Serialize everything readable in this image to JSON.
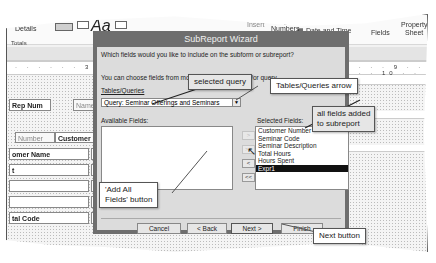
{
  "background": {
    "ribbon": {
      "details_label": "Details",
      "aa_label": "Aa",
      "insert_image_label": "Insert",
      "page_numbers_label": "Page",
      "page_numbers_sub": "Numbers",
      "date_time_label": "Date and Time",
      "add_fields_label": "Fields",
      "property_sheet_label": "Property",
      "property_sheet_sub": "Sheet"
    },
    "totals_label": "Totals",
    "ruler_left": "· · · · · · 3 · · · · · 4 · · · ·",
    "ruler_right": "· · · · 9 · · · · · 10 · ·",
    "report_fields": [
      {
        "label": "Rep Num"
      },
      {
        "label": "Name"
      },
      {
        "label": "Number"
      },
      {
        "label": "Customer Num"
      },
      {
        "label": "omer Name"
      },
      {
        "label": "t"
      },
      {
        "label": ""
      },
      {
        "label": ""
      },
      {
        "label": "tal Code"
      }
    ]
  },
  "dialog": {
    "title": "SubReport Wizard",
    "question": "Which fields would you like to include on the subform or subreport?",
    "instructions": "You can choose fields from more than one table and/or query.",
    "tables_queries_label": "Tables/Queries",
    "tables_queries_value": "Query: Seminar Offerings and Seminars",
    "available_fields_label": "Available Fields:",
    "available_fields": [],
    "selected_fields_label": "Selected Fields:",
    "selected_fields": [
      "Customer Number",
      "Seminar Code",
      "Seminar Description",
      "Total Hours",
      "Hours Spent",
      "Expr1"
    ],
    "selected_index": 5,
    "move_buttons": {
      "add_one": ">",
      "add_all": ">>",
      "remove_one": "<",
      "remove_all": "<<"
    },
    "buttons": {
      "cancel": "Cancel",
      "back": "< Back",
      "next": "Next >",
      "finish": "Finish"
    }
  },
  "callouts": {
    "selected_query": "selected query",
    "tables_queries_arrow": "Tables/Queries arrow",
    "all_fields_added": "all fields added\nto subreport",
    "all_fields_added_line1": "all fields added",
    "all_fields_added_line2": "to subreport",
    "add_all_fields_line1": "'Add All",
    "add_all_fields_line2": "Fields' button",
    "next_button": "Next button"
  }
}
